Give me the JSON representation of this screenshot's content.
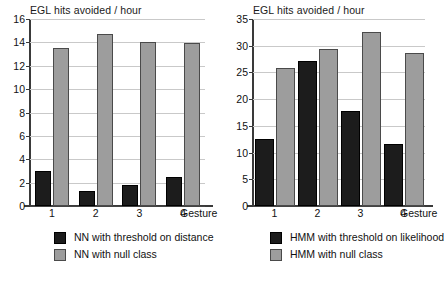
{
  "chart_data": [
    {
      "type": "bar",
      "title": "EGL hits avoided / hour",
      "xlabel": "Gesture",
      "ylabel": "",
      "categories": [
        "1",
        "2",
        "3",
        "4"
      ],
      "ylim": [
        0,
        16
      ],
      "yticks": [
        0,
        2,
        4,
        6,
        8,
        10,
        12,
        14,
        16
      ],
      "grid": true,
      "legend_position": "below",
      "series": [
        {
          "name": "NN with threshold on distance",
          "color": "#1c1c1c",
          "values": [
            3.0,
            1.3,
            1.8,
            2.5
          ]
        },
        {
          "name": "NN with null class",
          "color": "#9d9d9d",
          "values": [
            13.5,
            14.7,
            14.0,
            13.95
          ]
        }
      ]
    },
    {
      "type": "bar",
      "title": "EGL hits avoided / hour",
      "xlabel": "Gesture",
      "ylabel": "",
      "categories": [
        "1",
        "2",
        "3",
        "4"
      ],
      "ylim": [
        0,
        35
      ],
      "yticks": [
        0,
        5,
        10,
        15,
        20,
        25,
        30,
        35
      ],
      "grid": true,
      "legend_position": "below",
      "series": [
        {
          "name": "HMM with threshold on likelihood",
          "color": "#1c1c1c",
          "values": [
            12.6,
            27.2,
            17.8,
            11.7
          ]
        },
        {
          "name": "HMM with null class",
          "color": "#9d9d9d",
          "values": [
            25.9,
            29.3,
            32.5,
            28.7
          ]
        }
      ]
    }
  ]
}
